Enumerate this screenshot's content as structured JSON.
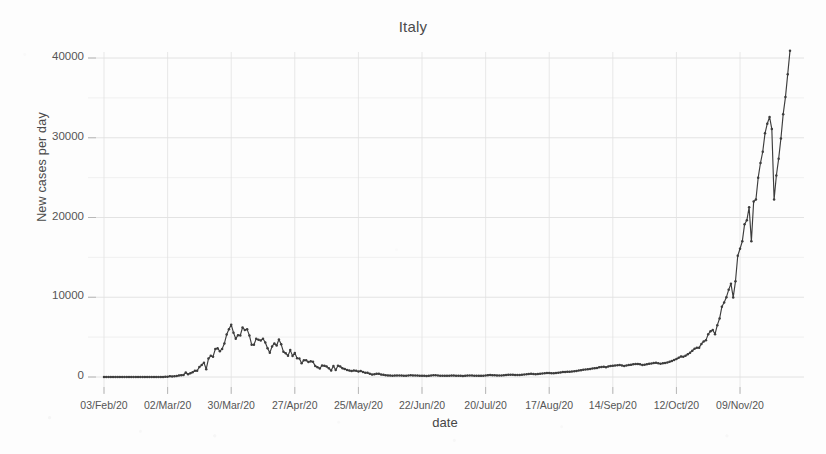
{
  "chart_data": {
    "type": "line",
    "title": "Italy",
    "xlabel": "date",
    "ylabel": "New cases per day",
    "ylim": [
      -1200,
      42500
    ],
    "yticks": [
      0,
      10000,
      20000,
      30000,
      40000
    ],
    "ytick_labels": [
      "0",
      "10000",
      "20000",
      "30000",
      "40000"
    ],
    "y_minor_step": 5000,
    "grid": true,
    "legend": "none",
    "marker": "filled-circle",
    "line_color": "#3d3d3d",
    "grid_color": "#e2e2e2",
    "xtick_labels": [
      "03/Feb/20",
      "02/Mar/20",
      "30/Mar/20",
      "27/Apr/20",
      "25/May/20",
      "22/Jun/20",
      "20/Jul/20",
      "17/Aug/20",
      "14/Sep/20",
      "12/Oct/20",
      "09/Nov/20"
    ],
    "xtick_indices": [
      0,
      28,
      56,
      84,
      112,
      140,
      168,
      196,
      224,
      252,
      280
    ],
    "x_start_label": "03/Feb/20",
    "x_end_label": "09/Nov/20",
    "n_points": 281,
    "annotations": [
      "Spring wave peaks near 6900 cases around 21/Mar/20",
      "Summer plateau near 200-300 cases per day during Jul/20",
      "Autumn exponential rise from early Oct/20",
      "Final value near 40500 cases on 09/Nov/20"
    ],
    "values": [
      0,
      0,
      0,
      0,
      0,
      0,
      0,
      0,
      0,
      0,
      0,
      0,
      0,
      0,
      0,
      0,
      0,
      0,
      0,
      0,
      0,
      0,
      0,
      2,
      0,
      0,
      0,
      17,
      42,
      93,
      74,
      93,
      131,
      202,
      233,
      240,
      566,
      342,
      466,
      587,
      769,
      778,
      1247,
      1492,
      1797,
      977,
      2313,
      2651,
      2547,
      3497,
      3590,
      3233,
      3526,
      4207,
      5322,
      5986,
      6557,
      5560,
      4789,
      5249,
      5210,
      6203,
      5909,
      5974,
      5217,
      4050,
      4053,
      4782,
      4668,
      4585,
      4805,
      4316,
      3599,
      3039,
      3836,
      4204,
      3951,
      4694,
      4092,
      3153,
      2972,
      2667,
      3370,
      2646,
      3021,
      2357,
      2324,
      1739,
      2091,
      2086,
      1872,
      1965,
      1900,
      1389,
      1221,
      1075,
      1444,
      1401,
      1327,
      1083,
      802,
      1389,
      888,
      1402,
      1327,
      1083,
      992,
      875,
      802,
      744,
      813,
      789,
      675,
      744,
      642,
      531,
      518,
      397,
      300,
      333,
      416,
      397,
      300,
      270,
      210,
      197,
      177,
      162,
      175,
      187,
      194,
      175,
      162,
      152,
      190,
      215,
      200,
      182,
      174,
      163,
      152,
      146,
      138,
      142,
      187,
      223,
      208,
      190,
      170,
      162,
      148,
      155,
      170,
      190,
      180,
      162,
      151,
      142,
      138,
      145,
      175,
      194,
      183,
      168,
      155,
      148,
      142,
      158,
      186,
      229,
      259,
      234,
      212,
      198,
      188,
      195,
      222,
      252,
      272,
      295,
      279,
      262,
      246,
      255,
      283,
      312,
      345,
      386,
      402,
      379,
      356,
      380,
      412,
      445,
      468,
      492,
      511,
      482,
      469,
      502,
      540,
      578,
      612,
      640,
      672,
      651,
      688,
      723,
      765,
      812,
      858,
      903,
      945,
      978,
      1008,
      1072,
      1108,
      1144,
      1210,
      1255,
      1297,
      1229,
      1326,
      1392,
      1397,
      1440,
      1470,
      1508,
      1452,
      1380,
      1434,
      1491,
      1526,
      1585,
      1616,
      1640,
      1587,
      1503,
      1545,
      1597,
      1648,
      1695,
      1741,
      1786,
      1724,
      1670,
      1712,
      1766,
      1818,
      1912,
      2019,
      2125,
      2257,
      2410,
      2578,
      2548,
      2677,
      2844,
      3050,
      3285,
      3553,
      3679,
      3678,
      4150,
      4458,
      4619,
      5372,
      5724,
      5901,
      5372,
      6500,
      7332,
      8804,
      9338,
      10010,
      10925,
      11705,
      9983,
      12000,
      15199,
      16079,
      17012,
      19143,
      19644,
      21273,
      17012,
      21994,
      22253,
      24991,
      26831,
      28244,
      30550,
      31758,
      32616,
      31084,
      22253,
      25271,
      27354,
      29907,
      32961,
      35098,
      37978,
      40902
    ]
  }
}
